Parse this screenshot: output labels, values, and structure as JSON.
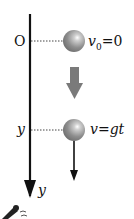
{
  "diagram": {
    "origin_label": "O",
    "axis_label": "y",
    "position_label": "y",
    "initial_state": {
      "var": "v",
      "sub": "0",
      "eq": "=0"
    },
    "later_state": {
      "text": "v=gt"
    },
    "colors": {
      "axis": "#111111",
      "ball": "#8a8a8a",
      "ball_highlight": "#f2f2f2",
      "motion_arrow": "#7a7a7a",
      "dotted": "#444444"
    }
  }
}
